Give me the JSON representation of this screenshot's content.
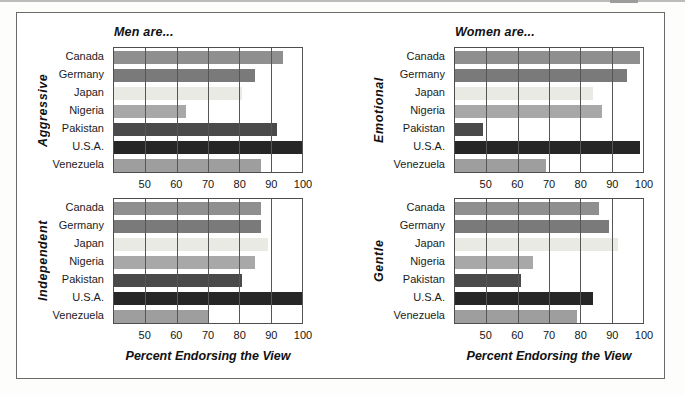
{
  "figure": {
    "panel_titles": {
      "left": "Men are...",
      "right": "Women are..."
    },
    "x_axis_label": "Percent Endorsing the View",
    "countries": [
      "Canada",
      "Germany",
      "Japan",
      "Nigeria",
      "Pakistan",
      "U.S.A.",
      "Venezuela"
    ],
    "bar_colors": {
      "Canada": "#8f8f8f",
      "Germany": "#7a7a7a",
      "Japan": "#eaeae5",
      "Nigeria": "#a8a8a8",
      "Pakistan": "#4a4a4a",
      "U.S.A.": "#262626",
      "Venezuela": "#9e9e9e"
    },
    "axis": {
      "min": 40,
      "max": 100,
      "ticks": [
        50,
        60,
        70,
        80,
        90,
        100
      ],
      "grid": true
    }
  },
  "chart_data": [
    {
      "type": "bar",
      "orientation": "horizontal",
      "panel": "top-left",
      "group_title": "Men are...",
      "trait": "Aggressive",
      "categories": [
        "Canada",
        "Germany",
        "Japan",
        "Nigeria",
        "Pakistan",
        "U.S.A.",
        "Venezuela"
      ],
      "values": [
        94,
        85,
        81,
        63,
        92,
        100,
        87
      ],
      "xlim": [
        40,
        100
      ],
      "xticks": [
        50,
        60,
        70,
        80,
        90,
        100
      ],
      "xlabel": "Percent Endorsing the View"
    },
    {
      "type": "bar",
      "orientation": "horizontal",
      "panel": "top-right",
      "group_title": "Women are...",
      "trait": "Emotional",
      "categories": [
        "Canada",
        "Germany",
        "Japan",
        "Nigeria",
        "Pakistan",
        "U.S.A.",
        "Venezuela"
      ],
      "values": [
        99,
        95,
        84,
        87,
        49,
        99,
        69
      ],
      "xlim": [
        40,
        100
      ],
      "xticks": [
        50,
        60,
        70,
        80,
        90,
        100
      ],
      "xlabel": "Percent Endorsing the View"
    },
    {
      "type": "bar",
      "orientation": "horizontal",
      "panel": "bottom-left",
      "group_title": "Men are...",
      "trait": "Independent",
      "categories": [
        "Canada",
        "Germany",
        "Japan",
        "Nigeria",
        "Pakistan",
        "U.S.A.",
        "Venezuela"
      ],
      "values": [
        87,
        87,
        89,
        85,
        81,
        100,
        70
      ],
      "xlim": [
        40,
        100
      ],
      "xticks": [
        50,
        60,
        70,
        80,
        90,
        100
      ],
      "xlabel": "Percent Endorsing the View"
    },
    {
      "type": "bar",
      "orientation": "horizontal",
      "panel": "bottom-right",
      "group_title": "Women are...",
      "trait": "Gentle",
      "categories": [
        "Canada",
        "Germany",
        "Japan",
        "Nigeria",
        "Pakistan",
        "U.S.A.",
        "Venezuela"
      ],
      "values": [
        86,
        89,
        92,
        65,
        61,
        84,
        79
      ],
      "xlim": [
        40,
        100
      ],
      "xticks": [
        50,
        60,
        70,
        80,
        90,
        100
      ],
      "xlabel": "Percent Endorsing the View"
    }
  ]
}
